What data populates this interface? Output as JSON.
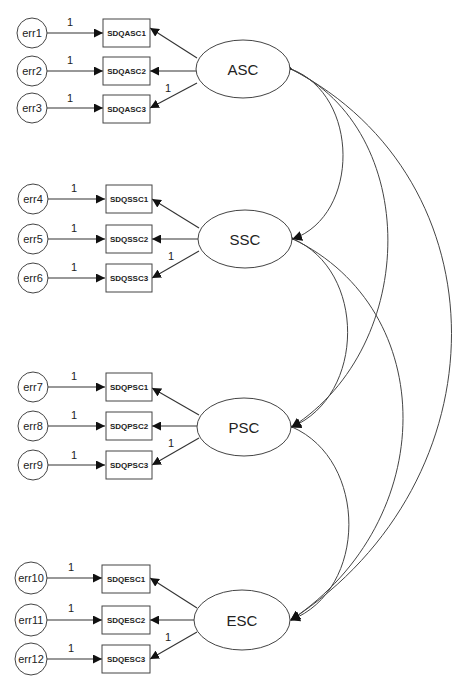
{
  "diagram": {
    "type": "sem-path-diagram",
    "latent_factors": [
      {
        "id": "ASC",
        "label": "ASC",
        "cx": 243,
        "cy": 69
      },
      {
        "id": "SSC",
        "label": "SSC",
        "cx": 245,
        "cy": 239
      },
      {
        "id": "PSC",
        "label": "PSC",
        "cx": 244,
        "cy": 427
      },
      {
        "id": "ESC",
        "label": "ESC",
        "cx": 242,
        "cy": 620
      }
    ],
    "groups": [
      {
        "factor": "ASC",
        "rows": [
          {
            "error": "err1",
            "indicator": "SDQASC1",
            "y": 33,
            "error_weight": "1",
            "loading": ""
          },
          {
            "error": "err2",
            "indicator": "SDQASC2",
            "y": 71,
            "error_weight": "1",
            "loading": ""
          },
          {
            "error": "err3",
            "indicator": "SDQASC3",
            "y": 108,
            "error_weight": "1",
            "loading": "1"
          }
        ]
      },
      {
        "factor": "SSC",
        "rows": [
          {
            "error": "err4",
            "indicator": "SDQSSC1",
            "y": 199,
            "error_weight": "1",
            "loading": ""
          },
          {
            "error": "err5",
            "indicator": "SDQSSC2",
            "y": 239,
            "error_weight": "1",
            "loading": ""
          },
          {
            "error": "err6",
            "indicator": "SDQSSC3",
            "y": 278,
            "error_weight": "1",
            "loading": "1"
          }
        ]
      },
      {
        "factor": "PSC",
        "rows": [
          {
            "error": "err7",
            "indicator": "SDQPSC1",
            "y": 387,
            "error_weight": "1",
            "loading": ""
          },
          {
            "error": "err8",
            "indicator": "SDQPSC2",
            "y": 426,
            "error_weight": "1",
            "loading": ""
          },
          {
            "error": "err9",
            "indicator": "SDQPSC3",
            "y": 465,
            "error_weight": "1",
            "loading": "1"
          }
        ]
      },
      {
        "factor": "ESC",
        "rows": [
          {
            "error": "err10",
            "indicator": "SDQESC1",
            "y": 578,
            "error_weight": "1",
            "loading": ""
          },
          {
            "error": "err11",
            "indicator": "SDQESC2",
            "y": 620,
            "error_weight": "1",
            "loading": ""
          },
          {
            "error": "err12",
            "indicator": "SDQESC3",
            "y": 659,
            "error_weight": "1",
            "loading": "1"
          }
        ]
      }
    ],
    "covariances": [
      {
        "from": "ASC",
        "to": "SSC"
      },
      {
        "from": "ASC",
        "to": "PSC"
      },
      {
        "from": "ASC",
        "to": "ESC"
      },
      {
        "from": "SSC",
        "to": "PSC"
      },
      {
        "from": "SSC",
        "to": "ESC"
      },
      {
        "from": "PSC",
        "to": "ESC"
      }
    ],
    "colors": {
      "stroke": "#444444",
      "text": "#222222",
      "background": "#ffffff"
    }
  }
}
